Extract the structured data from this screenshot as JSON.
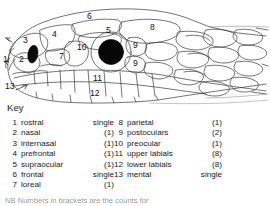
{
  "figure": {
    "key_heading": "Key",
    "note": "NB Numbers in brackets are the counts for",
    "diagram_labels": [
      {
        "id": "1",
        "text": "1",
        "x": 3,
        "y": 58
      },
      {
        "id": "2",
        "text": "2",
        "x": 19,
        "y": 57
      },
      {
        "id": "3",
        "text": "3",
        "x": 23,
        "y": 38
      },
      {
        "id": "4",
        "text": "4",
        "x": 52,
        "y": 32
      },
      {
        "id": "5",
        "text": "5",
        "x": 106,
        "y": 28
      },
      {
        "id": "6",
        "text": "6",
        "x": 87,
        "y": 14
      },
      {
        "id": "7",
        "text": "7",
        "x": 59,
        "y": 54
      },
      {
        "id": "8",
        "text": "8",
        "x": 150,
        "y": 25
      },
      {
        "id": "9a",
        "text": "9",
        "x": 134,
        "y": 43
      },
      {
        "id": "9b",
        "text": "9",
        "x": 134,
        "y": 61
      },
      {
        "id": "10",
        "text": "10",
        "x": 79,
        "y": 45
      },
      {
        "id": "11",
        "text": "11",
        "x": 94,
        "y": 76
      },
      {
        "id": "12",
        "text": "12",
        "x": 91,
        "y": 91
      },
      {
        "id": "13",
        "text": "13",
        "x": 8,
        "y": 84
      }
    ],
    "key_left": [
      {
        "num": "1",
        "name": "rostral",
        "value": "single"
      },
      {
        "num": "2",
        "name": "nasal",
        "value": "(1)"
      },
      {
        "num": "3",
        "name": "internasal",
        "value": "(1)"
      },
      {
        "num": "4",
        "name": "prefrontal",
        "value": "(1)"
      },
      {
        "num": "5",
        "name": "supraocular",
        "value": "(1)"
      },
      {
        "num": "6",
        "name": "frontal",
        "value": "single"
      },
      {
        "num": "7",
        "name": "loreal",
        "value": "(1)"
      }
    ],
    "key_right": [
      {
        "num": "8",
        "name": "parietal",
        "value": "(1)"
      },
      {
        "num": "9",
        "name": "postoculars",
        "value": "(2)"
      },
      {
        "num": "10",
        "name": "preocular",
        "value": "(1)"
      },
      {
        "num": "11",
        "name": "upper labials",
        "value": "(8)"
      },
      {
        "num": "12",
        "name": "lower labials",
        "value": "(8)"
      },
      {
        "num": "13",
        "name": "mental",
        "value": "single"
      }
    ],
    "colors": {
      "line": "#333333",
      "fill": "#ffffff",
      "pupil": "#000000",
      "nostril": "#000000",
      "text": "#1a1a1a"
    }
  }
}
